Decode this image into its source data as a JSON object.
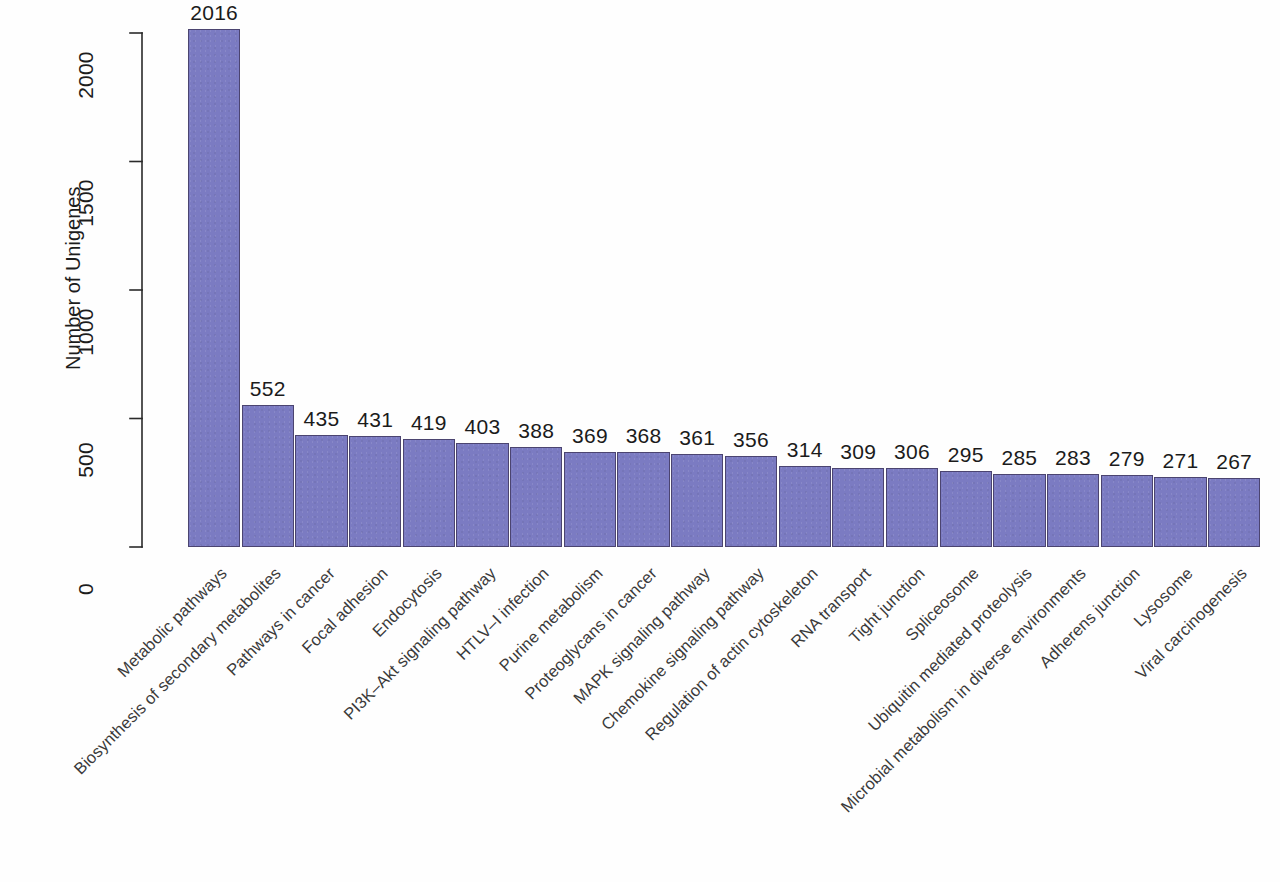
{
  "figure": {
    "background_color": "#fefefe",
    "bar_fill_color": "#7b7bc2",
    "bar_edge_color": "#4b4470",
    "text_color": "#1c1c1c"
  },
  "chart_data": {
    "type": "bar",
    "title": "",
    "xlabel": "",
    "ylabel": "Number of Unigenes",
    "ylim": [
      0,
      2100
    ],
    "yticks": [
      0,
      500,
      1000,
      1500,
      2000
    ],
    "ytick_labels": [
      "0",
      "500",
      "1000",
      "1500",
      "2000"
    ],
    "grid": false,
    "legend": null,
    "categories": [
      "Metabolic pathways",
      "Biosynthesis of secondary metabolites",
      "Pathways in cancer",
      "Focal adhesion",
      "Endocytosis",
      "PI3K–Akt signaling pathway",
      "HTLV–I infection",
      "Purine metabolism",
      "Proteoglycans in cancer",
      "MAPK signaling pathway",
      "Chemokine signaling pathway",
      "Regulation of actin cytoskeleton",
      "RNA transport",
      "Tight junction",
      "Spliceosome",
      "Ubiquitin mediated proteolysis",
      "Microbial metabolism in diverse environments",
      "Adherens junction",
      "Lysosome",
      "Viral carcinogenesis"
    ],
    "values": [
      2016,
      552,
      435,
      431,
      419,
      403,
      388,
      369,
      368,
      361,
      356,
      314,
      309,
      306,
      295,
      285,
      283,
      279,
      271,
      267
    ],
    "value_labels": [
      "2016",
      "552",
      "435",
      "431",
      "419",
      "403",
      "388",
      "369",
      "368",
      "361",
      "356",
      "314",
      "309",
      "306",
      "295",
      "285",
      "283",
      "279",
      "271",
      "267"
    ]
  }
}
